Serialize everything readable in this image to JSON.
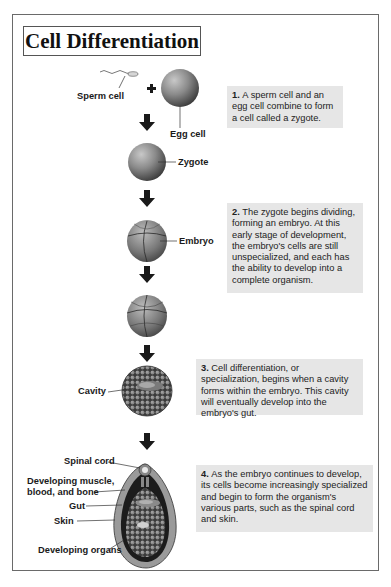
{
  "title": "Cell Differentiation",
  "labels": {
    "sperm_cell": "Sperm cell",
    "plus": "+",
    "egg_cell": "Egg cell",
    "zygote": "Zygote",
    "embryo": "Embryo",
    "cavity": "Cavity",
    "spinal_cord": "Spinal cord",
    "muscle_line1": "Developing muscle,",
    "muscle_line2": "blood, and bone",
    "gut": "Gut",
    "skin": "Skin",
    "organs": "Developing organs"
  },
  "steps": [
    {
      "number": "1.",
      "text": "A sperm cell and an egg cell combine to form a cell called a zygote."
    },
    {
      "number": "2.",
      "text": "The zygote begins dividing, forming an embryo. At this early stage of development, the embryo's cells are still unspecialized, and each has the ability to develop into a complete organism."
    },
    {
      "number": "3.",
      "text": "Cell differentiation, or specialization, begins when a cavity forms within the embryo. This cavity will eventually develop into the embryo's gut."
    },
    {
      "number": "4.",
      "text": "As the embryo continues to develop, its cells become increasingly specialized and begin to form the organism's various parts, such as the spinal cord and skin."
    }
  ],
  "colors": {
    "note_bg": "#e6e6e6",
    "arrow": "#1a1a1a"
  }
}
